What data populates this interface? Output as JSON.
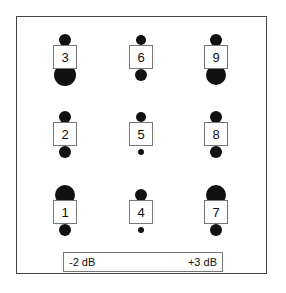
{
  "diagram": {
    "colors": {
      "dot": "#111111",
      "border": "#777777",
      "frame": "#444444"
    },
    "nodes": [
      {
        "label": "3",
        "x": 65,
        "y": 57,
        "top_r": 6,
        "bottom_r": 11
      },
      {
        "label": "6",
        "x": 141,
        "y": 57,
        "top_r": 5,
        "bottom_r": 6
      },
      {
        "label": "9",
        "x": 216,
        "y": 57,
        "top_r": 6,
        "bottom_r": 10
      },
      {
        "label": "2",
        "x": 65,
        "y": 134,
        "top_r": 6,
        "bottom_r": 6
      },
      {
        "label": "5",
        "x": 141,
        "y": 134,
        "top_r": 5,
        "bottom_r": 3
      },
      {
        "label": "8",
        "x": 216,
        "y": 134,
        "top_r": 6,
        "bottom_r": 6
      },
      {
        "label": "1",
        "x": 65,
        "y": 212,
        "top_r": 10,
        "bottom_r": 6
      },
      {
        "label": "4",
        "x": 141,
        "y": 212,
        "top_r": 6,
        "bottom_r": 3
      },
      {
        "label": "7",
        "x": 216,
        "y": 212,
        "top_r": 10,
        "bottom_r": 6
      }
    ],
    "legend": {
      "min_label": "-2 dB",
      "max_label": "+3 dB",
      "dot_radii": [
        1,
        2,
        3.5,
        5,
        6.5,
        8
      ],
      "dot_x": [
        106,
        119,
        133,
        147,
        162,
        178
      ]
    }
  }
}
